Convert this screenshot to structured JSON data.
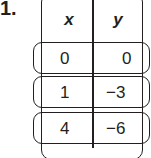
{
  "problem": {
    "number": "1."
  },
  "table": {
    "headers": [
      "x",
      "y"
    ],
    "rows": [
      {
        "x": "0",
        "y": "0"
      },
      {
        "x": "1",
        "y": "−3"
      },
      {
        "x": "4",
        "y": "−6"
      }
    ]
  }
}
